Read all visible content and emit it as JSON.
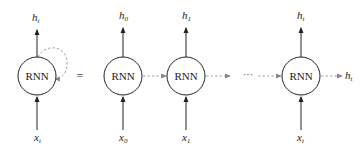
{
  "diagram": {
    "type": "rnn-unrolling",
    "equals_symbol": "=",
    "ellipsis": "···",
    "colors": {
      "stroke": "#222222",
      "dashed": "#999999",
      "background": "#ffffff"
    },
    "folded": {
      "label": "RNN",
      "output": {
        "base": "h",
        "sub": "t"
      },
      "input": {
        "base": "x",
        "sub": "t"
      }
    },
    "unrolled": [
      {
        "label": "RNN",
        "output": {
          "base": "h",
          "sub": "0"
        },
        "input": {
          "base": "x",
          "sub": "0"
        }
      },
      {
        "label": "RNN",
        "output": {
          "base": "h",
          "sub": "1"
        },
        "input": {
          "base": "x",
          "sub": "1"
        }
      },
      {
        "label": "RNN",
        "output": {
          "base": "h",
          "sub": "t"
        },
        "input": {
          "base": "x",
          "sub": "t"
        },
        "right_output": {
          "base": "h",
          "sub": "t"
        }
      }
    ]
  }
}
